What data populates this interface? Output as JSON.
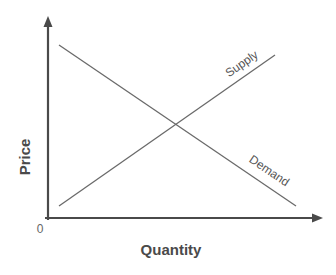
{
  "diagram": {
    "type": "supply-demand",
    "x_axis": {
      "label": "Quantity"
    },
    "y_axis": {
      "label": "Price"
    },
    "origin_label": "0",
    "curves": [
      {
        "name": "Supply",
        "label": "Supply",
        "direction": "upward-sloping"
      },
      {
        "name": "Demand",
        "label": "Demand",
        "direction": "downward-sloping"
      }
    ],
    "equilibrium": {
      "description": "intersection of supply and demand"
    },
    "colors": {
      "axis": "#4a4a4a",
      "curve": "#6a6a6a",
      "text": "#4a4a4a",
      "background": "#ffffff"
    }
  }
}
